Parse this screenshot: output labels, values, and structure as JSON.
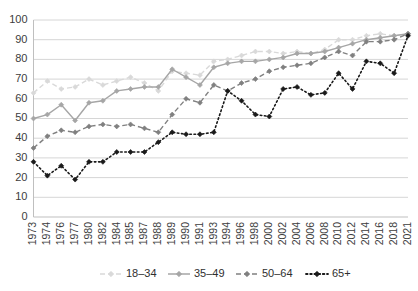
{
  "chart_data": {
    "type": "line",
    "title": "",
    "subtitle": "",
    "xlabel": "",
    "ylabel": "",
    "ylim": [
      0,
      100
    ],
    "ytick_step": 10,
    "yticks": [
      0,
      10,
      20,
      30,
      40,
      50,
      60,
      70,
      80,
      90,
      100
    ],
    "grid": true,
    "legend_position": "bottom",
    "categories": [
      "1973",
      "1974",
      "1976",
      "1977",
      "1980",
      "1982",
      "1984",
      "1985",
      "1987",
      "1988",
      "1989",
      "1990",
      "1991",
      "1993",
      "1994",
      "1996",
      "1998",
      "2000",
      "2002",
      "2004",
      "2006",
      "2008",
      "2010",
      "2012",
      "2014",
      "2016",
      "2018",
      "2021"
    ],
    "series": [
      {
        "name": "18–34",
        "color": "#d9d9d9",
        "marker": "diamond",
        "linestyle": "dashed",
        "values": [
          63,
          69,
          65,
          66,
          70,
          67,
          69,
          71,
          68,
          64,
          74,
          73,
          72,
          79,
          80,
          82,
          84,
          84,
          83,
          84,
          83,
          85,
          90,
          90,
          92,
          93,
          92,
          93
        ]
      },
      {
        "name": "35–49",
        "color": "#a6a6a6",
        "marker": "diamond",
        "linestyle": "solid",
        "values": [
          50,
          52,
          57,
          49,
          58,
          59,
          64,
          65,
          66,
          66,
          75,
          71,
          67,
          76,
          78,
          79,
          79,
          80,
          81,
          83,
          83,
          84,
          86,
          88,
          90,
          91,
          92,
          93
        ]
      },
      {
        "name": "50–64",
        "color": "#808080",
        "marker": "diamond",
        "linestyle": "dashed",
        "values": [
          35,
          41,
          44,
          43,
          46,
          47,
          46,
          47,
          45,
          43,
          52,
          60,
          58,
          67,
          64,
          68,
          70,
          74,
          76,
          77,
          78,
          81,
          84,
          82,
          89,
          89,
          90,
          93
        ]
      },
      {
        "name": "65+",
        "color": "#1a1a1a",
        "marker": "diamond",
        "linestyle": "dotted",
        "values": [
          28,
          21,
          26,
          19,
          28,
          28,
          33,
          33,
          33,
          38,
          43,
          42,
          42,
          43,
          64,
          59,
          52,
          51,
          65,
          66,
          62,
          63,
          73,
          65,
          79,
          78,
          73,
          92
        ]
      }
    ]
  },
  "legend": {
    "items": [
      {
        "label": "18–34"
      },
      {
        "label": "35–49"
      },
      {
        "label": "50–64"
      },
      {
        "label": "65+"
      }
    ]
  }
}
